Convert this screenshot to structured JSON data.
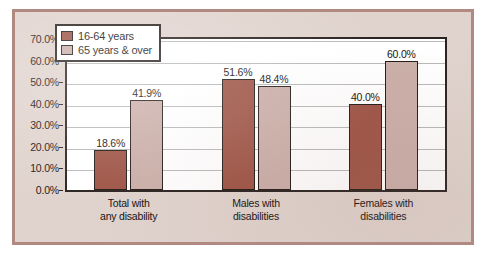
{
  "chart_data": {
    "type": "bar",
    "title": "",
    "xlabel": "",
    "ylabel": "",
    "categories": [
      "Total with any disability",
      "Males with disabilities",
      "Females with disabilities"
    ],
    "category_lines": [
      [
        "Total with",
        "any disability"
      ],
      [
        "Males with",
        "disabilities"
      ],
      [
        "Females with",
        "disabilities"
      ]
    ],
    "series": [
      {
        "name": "16-64 years",
        "color": "#9E5546",
        "values": [
          18.6,
          51.6,
          40.0
        ],
        "labels": [
          "18.6%",
          "51.6%",
          "40.0%"
        ]
      },
      {
        "name": "65 years & over",
        "color": "#CBAFA9",
        "values": [
          41.9,
          48.4,
          60.0
        ],
        "labels": [
          "41.9%",
          "48.4%",
          "60.0%"
        ]
      }
    ],
    "ylim": [
      0,
      70
    ],
    "ytick_values": [
      0,
      10,
      20,
      30,
      40,
      50,
      60,
      70
    ],
    "ytick_labels": [
      "0.0%",
      "10.0%",
      "20.0%",
      "30.0%",
      "40.0%",
      "50.0%",
      "60.0%",
      "70.0%"
    ],
    "grid": true,
    "legend_position": "top-left",
    "legend_entries": [
      "16-64 years",
      "65 years & over"
    ]
  },
  "colors": {
    "series_0": "#9E5546",
    "series_1": "#CBAFA9",
    "paper": "#E0D3CD",
    "card_border": "#B08A80",
    "axis": "#2B2320",
    "gridline": "#B9B9B9"
  }
}
